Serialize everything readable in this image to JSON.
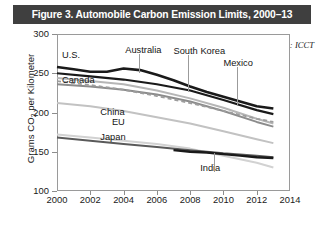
{
  "figure": {
    "title": "Figure 3. Automobile Carbon Emission Limits, 2000–13",
    "source": "Source: ICCT",
    "title_band_color": "#3f3f3f"
  },
  "chart_data": {
    "type": "line",
    "title": "Figure 3. Automobile Carbon Emission Limits, 2000–13",
    "xlabel": "",
    "ylabel": "Grams CO₂ per Kilometer",
    "ylabel_prefix": "Grams CO",
    "ylabel_sub": "2",
    "ylabel_suffix": " per Kilometer",
    "xlim": [
      2000,
      2014
    ],
    "ylim": [
      100,
      300
    ],
    "yticks": [
      100,
      150,
      200,
      250,
      300
    ],
    "xticks": [
      2000,
      2002,
      2004,
      2006,
      2008,
      2010,
      2012,
      2014
    ],
    "grid": false,
    "legend": "inline-labels",
    "annotation": "Source: ICCT",
    "series": [
      {
        "name": "U.S.",
        "color": "#1a1a1a",
        "width": 2.6,
        "dash": "none",
        "label_x": 2000.3,
        "label_y": 272,
        "leader": false,
        "x": [
          2000,
          2001,
          2002,
          2003,
          2004,
          2005,
          2006,
          2007,
          2008,
          2009,
          2010,
          2011,
          2012,
          2013
        ],
        "y": [
          258,
          255,
          252,
          252,
          256,
          254,
          248,
          241,
          233,
          226,
          220,
          214,
          208,
          205
        ]
      },
      {
        "name": "Canada",
        "color": "#1a1a1a",
        "width": 2.2,
        "dash": "none",
        "label_x": 2000.3,
        "label_y": 240,
        "leader": false,
        "x": [
          2000,
          2002,
          2004,
          2006,
          2008,
          2010,
          2012,
          2013
        ],
        "y": [
          250,
          246,
          242,
          236,
          228,
          216,
          203,
          198
        ]
      },
      {
        "name": "Australia",
        "color": "#b6b6b6",
        "width": 2.0,
        "dash": "none",
        "label_x": 2004.1,
        "label_y": 278,
        "leader": true,
        "leader_to_y": 250,
        "x": [
          2000,
          2002,
          2004,
          2006,
          2008,
          2010,
          2012,
          2013
        ],
        "y": [
          244,
          240,
          236,
          228,
          218,
          206,
          192,
          186
        ]
      },
      {
        "name": "South Korea",
        "color": "#8c8c8c",
        "width": 2.0,
        "dash": "none",
        "label_x": 2007.0,
        "label_y": 277,
        "leader": true,
        "leader_to_y": 226,
        "x": [
          2000,
          2002,
          2004,
          2006,
          2008,
          2010,
          2012,
          2013
        ],
        "y": [
          236,
          233,
          229,
          223,
          214,
          202,
          188,
          182
        ]
      },
      {
        "name": "Mexico",
        "color": "#9d9d9d",
        "width": 1.8,
        "dash": "4 3",
        "label_x": 2010.0,
        "label_y": 262,
        "leader": true,
        "leader_to_y": 208,
        "x": [
          2000,
          2002,
          2004,
          2006,
          2008,
          2010,
          2012,
          2013
        ],
        "y": [
          240,
          235,
          229,
          221,
          212,
          202,
          192,
          188
        ]
      },
      {
        "name": "China",
        "color": "#c2c2c2",
        "width": 2.0,
        "dash": "none",
        "label_x": 2002.6,
        "label_y": 200,
        "leader": false,
        "x": [
          2000,
          2002,
          2004,
          2006,
          2008,
          2010,
          2012,
          2013
        ],
        "y": [
          212,
          208,
          202,
          194,
          186,
          176,
          166,
          161
        ]
      },
      {
        "name": "EU",
        "color": "#d2d2d2",
        "width": 2.0,
        "dash": "none",
        "label_x": 2003.3,
        "label_y": 186,
        "leader": false,
        "x": [
          2000,
          2002,
          2004,
          2006,
          2008,
          2010,
          2012,
          2013
        ],
        "y": [
          172,
          168,
          164,
          160,
          154,
          145,
          136,
          130
        ]
      },
      {
        "name": "Japan",
        "color": "#5a5a5a",
        "width": 2.0,
        "dash": "none",
        "label_x": 2002.6,
        "label_y": 168,
        "leader": false,
        "x": [
          2000,
          2002,
          2004,
          2006,
          2008,
          2010,
          2012,
          2013
        ],
        "y": [
          168,
          164,
          160,
          156,
          152,
          148,
          145,
          143
        ]
      },
      {
        "name": "India",
        "color": "#1a1a1a",
        "width": 2.4,
        "dash": "none",
        "label_x": 2008.6,
        "label_y": 128,
        "leader": true,
        "leader_to_y": 148,
        "x": [
          2007,
          2008,
          2009,
          2010,
          2011,
          2012,
          2013
        ],
        "y": [
          152,
          150,
          149,
          147,
          145,
          143,
          142
        ]
      }
    ]
  }
}
